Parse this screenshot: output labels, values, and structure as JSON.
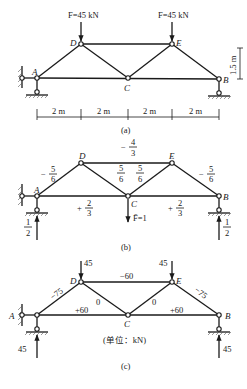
{
  "figure": {
    "panels": [
      {
        "id": "a",
        "caption": "(a)",
        "loads": [
          {
            "node": "D",
            "label": "F=45 kN"
          },
          {
            "node": "E",
            "label": "F=45 kN"
          }
        ],
        "dimensions": {
          "spans": [
            "2 m",
            "2 m",
            "2 m",
            "2 m"
          ],
          "height": "1.5 m"
        }
      },
      {
        "id": "b",
        "caption": "(b)",
        "unit_load": "F̄=1",
        "member_forces": {
          "AD": {
            "sign": "−",
            "num": "5",
            "den": "6"
          },
          "DE": {
            "sign": "−",
            "num": "4",
            "den": "3"
          },
          "DC": {
            "sign": "",
            "num": "5",
            "den": "6"
          },
          "CE": {
            "sign": "",
            "num": "5",
            "den": "6"
          },
          "EB": {
            "sign": "−",
            "num": "5",
            "den": "6"
          },
          "AC": {
            "sign": "+",
            "num": "2",
            "den": "3"
          },
          "CB": {
            "sign": "+",
            "num": "2",
            "den": "3"
          }
        },
        "reactions": {
          "A": {
            "num": "1",
            "den": "2"
          },
          "B": {
            "num": "1",
            "den": "2"
          }
        }
      },
      {
        "id": "c",
        "caption": "(c)",
        "unit_note": "(单位：kN)",
        "loads": {
          "D": "45",
          "E": "45"
        },
        "member_forces": {
          "AD": "−75",
          "DE": "−60",
          "DC": "0",
          "CE": "0",
          "EB": "−75",
          "AC": "+60",
          "CB": "+60"
        },
        "reactions": {
          "A": "45",
          "B": "45"
        }
      }
    ],
    "node_labels": {
      "A": "A",
      "B": "B",
      "C": "C",
      "D": "D",
      "E": "E"
    }
  }
}
